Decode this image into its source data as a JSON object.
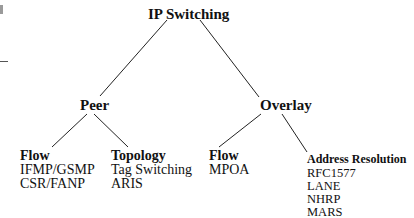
{
  "diagram": {
    "type": "tree",
    "root": {
      "label": "IP Switching"
    },
    "branches": [
      {
        "label": "Peer",
        "children": [
          {
            "heading": "Flow",
            "items": [
              "IFMP/GSMP",
              "CSR/FANP"
            ]
          },
          {
            "heading": "Topology",
            "items": [
              "Tag Switching",
              "ARIS"
            ]
          }
        ]
      },
      {
        "label": "Overlay",
        "children": [
          {
            "heading": "Flow",
            "items": [
              "MPOA"
            ]
          },
          {
            "heading": "Address Resolution",
            "items": [
              "RFC1577",
              "LANE",
              "NHRP",
              "MARS"
            ]
          }
        ]
      }
    ],
    "colors": {
      "line": "#222222",
      "text": "#111111",
      "background": "#ffffff"
    }
  }
}
